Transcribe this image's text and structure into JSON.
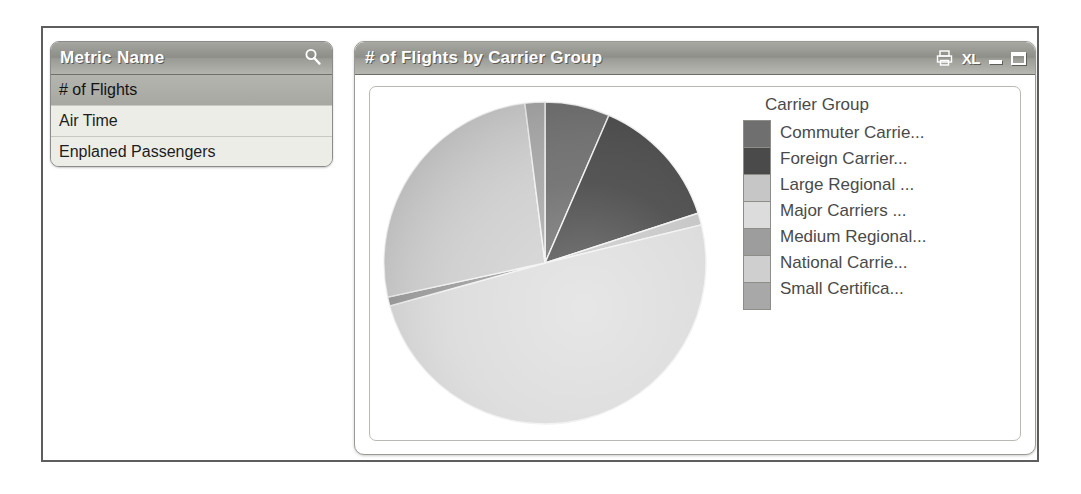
{
  "window": {
    "metric_panel": {
      "header_title": "Metric Name",
      "search_icon": "search-icon",
      "items": [
        {
          "label": "# of Flights",
          "selected": true
        },
        {
          "label": "Air Time",
          "selected": false
        },
        {
          "label": "Enplaned Passengers",
          "selected": false
        }
      ]
    },
    "chart_panel": {
      "title": "# of Flights by Carrier Group",
      "tools": [
        {
          "name": "print-icon",
          "label": ""
        },
        {
          "name": "export-excel-icon",
          "label": "XL"
        },
        {
          "name": "minimize-button",
          "label": ""
        },
        {
          "name": "maximize-button",
          "label": ""
        }
      ]
    }
  },
  "chart_data": {
    "type": "pie",
    "title": "# of Flights by Carrier Group",
    "legend_title": "Carrier Group",
    "legend_position": "right",
    "categories": [
      "Commuter Carrie...",
      "Foreign Carrier...",
      "Large Regional ...",
      "Major Carriers ...",
      "Medium Regional...",
      "National Carrie...",
      "Small Certifica..."
    ],
    "values": [
      6.5,
      13.5,
      1.2,
      49.5,
      0.9,
      26.4,
      2.0
    ],
    "value_unit": "percent",
    "colors": [
      "#6f6f6f",
      "#4a4a4a",
      "#c6c6c6",
      "#dcdcdc",
      "#9d9d9d",
      "#cfcfcf",
      "#a8a8a8"
    ],
    "xlabel": "",
    "ylabel": ""
  }
}
